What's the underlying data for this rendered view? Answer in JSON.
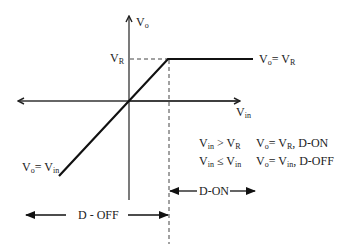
{
  "diagram": {
    "axes": {
      "y_label": {
        "main": "V",
        "sub": "o"
      },
      "x_label": {
        "main": "V",
        "sub": "in"
      }
    },
    "labels": {
      "vr_tick": {
        "main": "V",
        "sub": "R"
      },
      "upper_segment": {
        "lhs_main": "V",
        "lhs_sub": "o",
        "eq": "= ",
        "rhs_main": "V",
        "rhs_sub": "R"
      },
      "lower_segment": {
        "lhs_main": "V",
        "lhs_sub": "o",
        "eq": "= ",
        "rhs_main": "V",
        "rhs_sub": "in"
      }
    },
    "conditions": [
      {
        "cond_a_main": "V",
        "cond_a_sub": "in",
        "op": " > ",
        "cond_b_main": "V",
        "cond_b_sub": "R",
        "res_main": "V",
        "res_sub": "o",
        "res_eq": "= ",
        "res_val_main": "V",
        "res_val_sub": "R",
        "state": ", D-ON"
      },
      {
        "cond_a_main": "V",
        "cond_a_sub": "in",
        "op": " ≤ ",
        "cond_b_main": "V",
        "cond_b_sub": "in",
        "res_main": "V",
        "res_sub": "o",
        "res_eq": "= ",
        "res_val_main": "V",
        "res_val_sub": "in",
        "state": ", D-OFF"
      }
    ],
    "regions": {
      "off": "D - OFF",
      "on": "D-ON"
    },
    "colors": {
      "line": "#111111",
      "axis": "#333333",
      "dash": "#444444",
      "text": "#222222"
    }
  }
}
